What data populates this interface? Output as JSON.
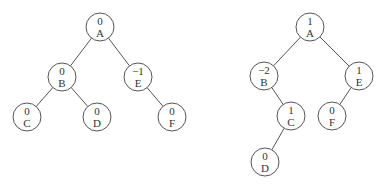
{
  "trees": [
    {
      "name": "left-tree",
      "nodes": [
        {
          "id": "A",
          "label": "A",
          "balance": "0",
          "x": 100,
          "y": 27
        },
        {
          "id": "B",
          "label": "B",
          "balance": "0",
          "x": 62,
          "y": 77
        },
        {
          "id": "E",
          "label": "E",
          "balance": "−1",
          "x": 138,
          "y": 77
        },
        {
          "id": "C",
          "label": "C",
          "balance": "0",
          "x": 27,
          "y": 117
        },
        {
          "id": "D",
          "label": "D",
          "balance": "0",
          "x": 97,
          "y": 117
        },
        {
          "id": "F",
          "label": "F",
          "balance": "0",
          "x": 172,
          "y": 117
        }
      ],
      "edges": [
        [
          "A",
          "B"
        ],
        [
          "A",
          "E"
        ],
        [
          "B",
          "C"
        ],
        [
          "B",
          "D"
        ],
        [
          "E",
          "F"
        ]
      ]
    },
    {
      "name": "right-tree",
      "nodes": [
        {
          "id": "A",
          "label": "A",
          "balance": "1",
          "x": 310,
          "y": 27
        },
        {
          "id": "B",
          "label": "B",
          "balance": "−2",
          "x": 264,
          "y": 76
        },
        {
          "id": "E",
          "label": "E",
          "balance": "1",
          "x": 359,
          "y": 76
        },
        {
          "id": "C",
          "label": "C",
          "balance": "1",
          "x": 291,
          "y": 116
        },
        {
          "id": "F",
          "label": "F",
          "balance": "0",
          "x": 332,
          "y": 116
        },
        {
          "id": "D",
          "label": "D",
          "balance": "0",
          "x": 265,
          "y": 162
        }
      ],
      "edges": [
        [
          "A",
          "B"
        ],
        [
          "A",
          "E"
        ],
        [
          "B",
          "C"
        ],
        [
          "E",
          "F"
        ],
        [
          "C",
          "D"
        ]
      ]
    }
  ],
  "style": {
    "radius": 14,
    "stroke": "#555555"
  }
}
